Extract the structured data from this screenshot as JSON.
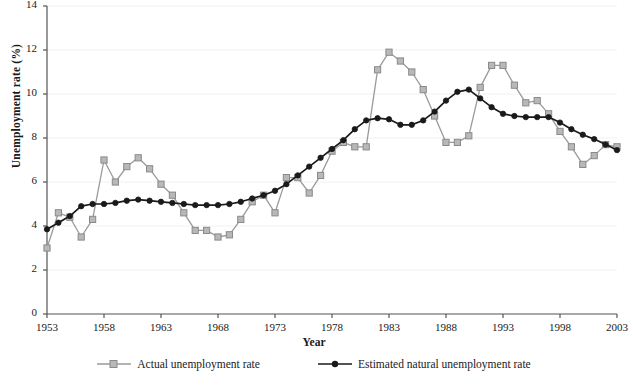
{
  "chart_data": {
    "type": "line",
    "title": "",
    "xlabel": "Year",
    "ylabel": "Unemployment rate (%)",
    "xlim": [
      1953,
      2003
    ],
    "ylim": [
      0,
      14
    ],
    "ytick_step": 2,
    "xtick_step": 5,
    "grid": true,
    "legend_position": "bottom",
    "yticks": [
      "0",
      "2",
      "4",
      "6",
      "8",
      "10",
      "12",
      "14"
    ],
    "xticks": [
      "1953",
      "1958",
      "1963",
      "1968",
      "1973",
      "1978",
      "1983",
      "1988",
      "1993",
      "1998",
      "2003"
    ],
    "x": [
      1953,
      1954,
      1955,
      1956,
      1957,
      1958,
      1959,
      1960,
      1961,
      1962,
      1963,
      1964,
      1965,
      1966,
      1967,
      1968,
      1969,
      1970,
      1971,
      1972,
      1973,
      1974,
      1975,
      1976,
      1977,
      1978,
      1979,
      1980,
      1981,
      1982,
      1983,
      1984,
      1985,
      1986,
      1987,
      1988,
      1989,
      1990,
      1991,
      1992,
      1993,
      1994,
      1995,
      1996,
      1997,
      1998,
      1999,
      2000,
      2001,
      2002,
      2003
    ],
    "series": [
      {
        "name": "Actual unemployment rate",
        "color": "#9a9a9a",
        "marker": "square",
        "marker_fill": "#b8b8b8",
        "values": [
          3.0,
          4.6,
          4.4,
          3.5,
          4.3,
          7.0,
          6.0,
          6.7,
          7.1,
          6.6,
          5.9,
          5.4,
          4.6,
          3.8,
          3.8,
          3.5,
          3.6,
          4.3,
          5.1,
          5.4,
          4.6,
          6.2,
          6.2,
          5.5,
          6.3,
          7.4,
          7.8,
          7.6,
          7.6,
          11.1,
          11.9,
          11.5,
          11.0,
          10.2,
          9.0,
          7.8,
          7.8,
          8.1,
          10.3,
          11.3,
          11.3,
          10.4,
          9.6,
          9.7,
          9.1,
          8.3,
          7.6,
          6.8,
          7.2,
          7.7,
          7.6
        ]
      },
      {
        "name": "Estimated natural unemployment rate",
        "color": "#1a1a1a",
        "marker": "circle",
        "marker_fill": "#1a1a1a",
        "values": [
          3.85,
          4.15,
          4.45,
          4.9,
          5.0,
          5.0,
          5.05,
          5.15,
          5.2,
          5.15,
          5.1,
          5.05,
          5.0,
          4.95,
          4.95,
          4.95,
          5.0,
          5.1,
          5.25,
          5.4,
          5.6,
          5.9,
          6.3,
          6.7,
          7.1,
          7.5,
          7.9,
          8.4,
          8.8,
          8.9,
          8.85,
          8.6,
          8.6,
          8.8,
          9.2,
          9.7,
          10.1,
          10.2,
          9.8,
          9.4,
          9.1,
          9.0,
          8.95,
          8.95,
          8.95,
          8.7,
          8.4,
          8.15,
          7.95,
          7.7,
          7.45
        ]
      }
    ]
  },
  "legend": {
    "items": [
      {
        "label": "Actual unemployment rate"
      },
      {
        "label": "Estimated natural unemployment rate"
      }
    ]
  },
  "colors": {
    "actual": "#9a9a9a",
    "natural": "#1a1a1a",
    "grid": "#f2f2f2",
    "axis": "#555555",
    "text": "#1a1a1a"
  }
}
